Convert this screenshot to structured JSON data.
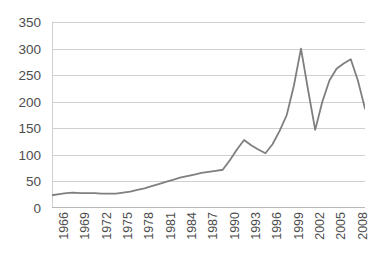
{
  "chart_data": {
    "type": "line",
    "title": "",
    "subtitle": "",
    "xlabel": "",
    "ylabel": "",
    "ylim": [
      0,
      350
    ],
    "y_ticks": [
      0,
      50,
      100,
      150,
      200,
      250,
      300,
      350
    ],
    "grid": "horizontal",
    "legend": "none",
    "line_color": "#7f7f7f",
    "gridline_color": "#d0d0d0",
    "background_color": "#ffffff",
    "tick_label_color": "#4d4d4d",
    "x_tick_labels": [
      "1966",
      "1969",
      "1972",
      "1975",
      "1978",
      "1981",
      "1984",
      "1987",
      "1990",
      "1993",
      "1996",
      "1999",
      "2002",
      "2005",
      "2008"
    ],
    "x_tick_step": 3,
    "x": [
      1966,
      1967,
      1968,
      1969,
      1970,
      1971,
      1972,
      1973,
      1974,
      1975,
      1976,
      1977,
      1978,
      1979,
      1980,
      1981,
      1982,
      1983,
      1984,
      1985,
      1986,
      1987,
      1988,
      1989,
      1990,
      1991,
      1992,
      1993,
      1994,
      1995,
      1996,
      1997,
      1998,
      1999,
      2000,
      2001,
      2002,
      2003,
      2004,
      2005,
      2006,
      2007,
      2008,
      2009,
      2010
    ],
    "series": [
      {
        "name": "Series 1",
        "values": [
          24,
          26,
          28,
          29,
          28,
          28,
          28,
          27,
          27,
          27,
          29,
          31,
          34,
          37,
          41,
          45,
          49,
          53,
          57,
          60,
          63,
          66,
          68,
          70,
          72,
          90,
          110,
          128,
          118,
          110,
          103,
          120,
          145,
          175,
          230,
          300,
          222,
          147,
          200,
          240,
          262,
          272,
          280,
          240,
          187
        ]
      }
    ]
  }
}
